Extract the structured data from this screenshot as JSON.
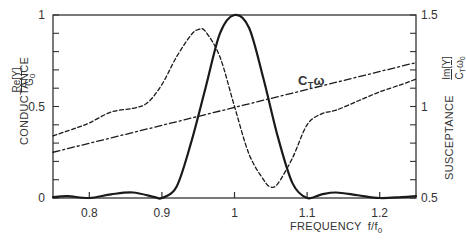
{
  "chart_data": {
    "type": "line",
    "title": "",
    "xlabel": "FREQUENCY f/f0",
    "ylabel_left": "CONDUCTANCE Re[Y]/G0",
    "ylabel_right": "SUSCEPTANCE Im[Y]/(CT ω0)",
    "xlim": [
      0.75,
      1.25
    ],
    "ylim_left": [
      0,
      1
    ],
    "ylim_right": [
      0.5,
      1.5
    ],
    "x_ticks": [
      0.8,
      0.9,
      1,
      1.1,
      1.2
    ],
    "x_tick_labels": [
      "0.8",
      "0.9",
      "1",
      "1.1",
      "1.2"
    ],
    "y_left_ticks": [
      0,
      0.5,
      1
    ],
    "y_left_tick_labels": [
      "0",
      "0.5",
      "1"
    ],
    "y_right_ticks": [
      0.5,
      1,
      1.5
    ],
    "y_right_tick_labels": [
      "0.5",
      "1",
      "1.5"
    ],
    "grid": false,
    "legend": "none",
    "annotations": [
      {
        "text": "CTω",
        "x": 1.07,
        "y_right": 1.27
      }
    ],
    "series": [
      {
        "name": "Conductance Re[Y]/G0",
        "axis": "left",
        "style": "solid",
        "x": [
          0.75,
          0.77,
          0.8,
          0.83,
          0.86,
          0.89,
          0.9,
          0.92,
          0.94,
          0.96,
          0.98,
          1.0,
          1.02,
          1.04,
          1.06,
          1.08,
          1.1,
          1.12,
          1.14,
          1.17,
          1.2,
          1.23,
          1.25
        ],
        "y": [
          0.005,
          0.01,
          0.0,
          0.02,
          0.03,
          0.005,
          0.0,
          0.06,
          0.3,
          0.6,
          0.9,
          1.0,
          0.93,
          0.65,
          0.33,
          0.08,
          0.0,
          0.02,
          0.03,
          0.015,
          0.0,
          0.005,
          0.01
        ]
      },
      {
        "name": "Susceptance Im[Y]/(CT ω0)",
        "axis": "right",
        "style": "dashed",
        "x": [
          0.75,
          0.78,
          0.8,
          0.83,
          0.86,
          0.88,
          0.9,
          0.92,
          0.94,
          0.95,
          0.96,
          0.98,
          1.0,
          1.02,
          1.04,
          1.05,
          1.06,
          1.08,
          1.1,
          1.12,
          1.14,
          1.17,
          1.2,
          1.23,
          1.25
        ],
        "y": [
          0.84,
          0.88,
          0.91,
          0.97,
          0.99,
          1.02,
          1.12,
          1.27,
          1.39,
          1.42,
          1.41,
          1.27,
          1.0,
          0.74,
          0.6,
          0.56,
          0.58,
          0.72,
          0.9,
          0.96,
          0.98,
          1.03,
          1.08,
          1.12,
          1.15
        ]
      },
      {
        "name": "CTω",
        "axis": "right",
        "style": "dash-dot",
        "x": [
          0.75,
          1.25
        ],
        "y": [
          0.75,
          1.24
        ]
      }
    ]
  },
  "labels": {
    "left_axis_title": "CONDUCTANCE",
    "left_frac_num": "Re[Y]",
    "left_frac_den": "G",
    "left_frac_den_sub": "0",
    "right_axis_title": "SUSCEPTANCE",
    "right_frac_num": "Im[Y]",
    "right_frac_den": "C",
    "right_frac_den_sub1": "T",
    "right_frac_den_mid": "ω",
    "right_frac_den_sub2": "0",
    "x_axis_title": "FREQUENCY",
    "x_axis_var": "f/f",
    "x_axis_var_sub": "0",
    "ctw_main": "C",
    "ctw_sub": "T",
    "ctw_omega": "ω"
  }
}
